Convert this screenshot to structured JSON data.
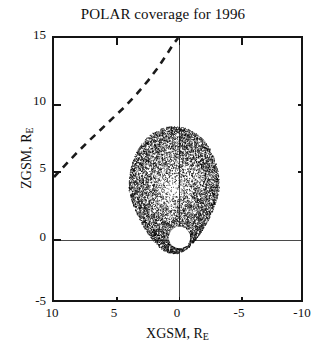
{
  "chart_data": {
    "type": "scatter",
    "title": "POLAR coverage for 1996",
    "xlabel": "XGSM, R",
    "xlabel_sub": "E",
    "ylabel": "ZGSM, R",
    "ylabel_sub": "E",
    "xlim": [
      10,
      -10
    ],
    "ylim": [
      -5,
      15
    ],
    "xticks": [
      10,
      5,
      0,
      -5,
      -10
    ],
    "xtick_labels": [
      "10",
      "5",
      "0",
      "-5",
      "-10"
    ],
    "yticks": [
      15,
      10,
      5,
      0,
      -5
    ],
    "ytick_labels": [
      "15",
      "10",
      "5",
      "0",
      "-5"
    ],
    "grid": false,
    "legend": "none",
    "axis_lines": {
      "x_zero_vertical": 0,
      "y_zero_horizontal": 0,
      "color": "#4a4a4a"
    },
    "series": [
      {
        "name": "POLAR orbital coverage",
        "type": "scatter",
        "marker": "point",
        "color": "#000000",
        "point_count": 9000,
        "description": "Dense teardrop-shaped cloud of orbit track points",
        "shape": {
          "center_x": 0.45,
          "center_z": 3.6,
          "half_width_x": 3.6,
          "top_z": 8.35,
          "bottom_z": -1.25,
          "apogee_z": 8.35,
          "perigee_z": -1.25
        },
        "exclusion_circle": {
          "name": "Earth exclusion region",
          "center_x": 0,
          "center_z": 0,
          "radius_re": 0.8,
          "fill": "#ffffff"
        }
      },
      {
        "name": "Model magnetopause",
        "type": "line",
        "linestyle": "dashed",
        "color": "#1a1a1a",
        "linewidth": 2.6,
        "dash_pattern": "7,6",
        "points_xz": [
          [
            10.0,
            4.55
          ],
          [
            9.2,
            5.35
          ],
          [
            8.3,
            6.25
          ],
          [
            7.4,
            7.1
          ],
          [
            6.4,
            8.0
          ],
          [
            5.4,
            8.9
          ],
          [
            4.4,
            9.8
          ],
          [
            3.4,
            10.8
          ],
          [
            2.5,
            11.8
          ],
          [
            1.7,
            12.8
          ],
          [
            1.0,
            13.8
          ],
          [
            0.45,
            14.6
          ],
          [
            0.1,
            15.0
          ]
        ]
      }
    ],
    "colors": {
      "axis": "#141414",
      "text": "#100f0f",
      "data": "#000000",
      "background": "#ffffff"
    }
  }
}
